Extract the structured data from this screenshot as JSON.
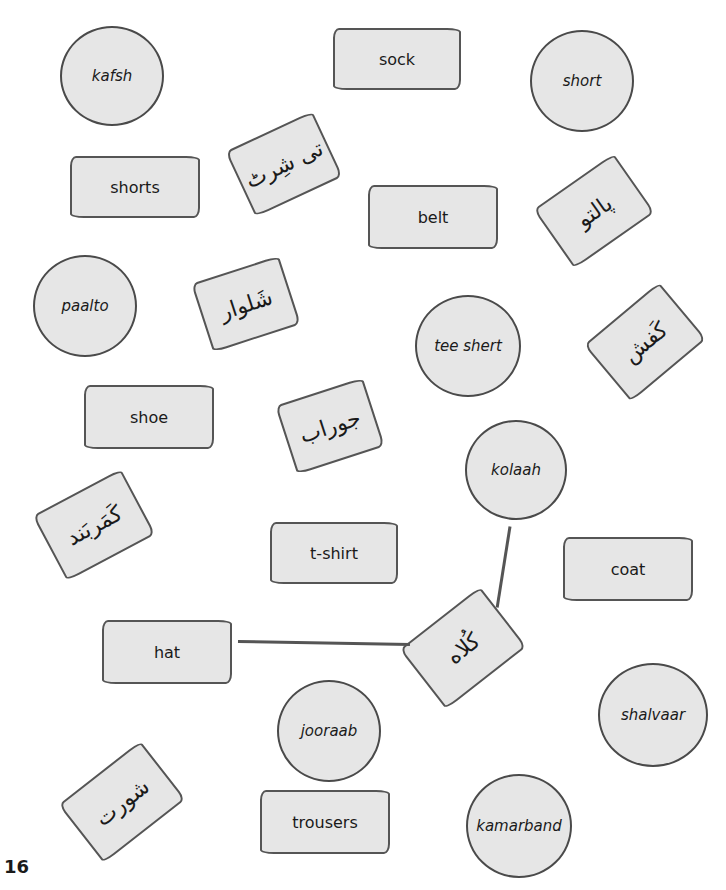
{
  "page": {
    "number": "16",
    "colors": {
      "card_fill": "#e6e6e6",
      "outline": "#4a4a4a",
      "background": "#ffffff"
    }
  },
  "circles": [
    {
      "id": "kafsh",
      "label": "kafsh"
    },
    {
      "id": "short",
      "label": "short"
    },
    {
      "id": "paalto",
      "label": "paalto"
    },
    {
      "id": "tee-shert",
      "label": "tee shert"
    },
    {
      "id": "kolaah",
      "label": "kolaah"
    },
    {
      "id": "jooraab",
      "label": "jooraab"
    },
    {
      "id": "shalvaar",
      "label": "shalvaar"
    },
    {
      "id": "kamarband",
      "label": "kamarband"
    }
  ],
  "english_cards": [
    {
      "id": "sock",
      "label": "sock"
    },
    {
      "id": "shorts",
      "label": "shorts"
    },
    {
      "id": "belt",
      "label": "belt"
    },
    {
      "id": "shoe",
      "label": "shoe"
    },
    {
      "id": "t-shirt",
      "label": "t-shirt"
    },
    {
      "id": "coat",
      "label": "coat"
    },
    {
      "id": "hat",
      "label": "hat"
    },
    {
      "id": "trousers",
      "label": "trousers"
    }
  ],
  "urdu_cards": [
    {
      "id": "tee-shirt-urdu",
      "label": "تی شِرٹ"
    },
    {
      "id": "paalto-urdu",
      "label": "پالتو"
    },
    {
      "id": "shalvaar-urdu",
      "label": "شَلوار"
    },
    {
      "id": "kafsh-urdu",
      "label": "کَفش"
    },
    {
      "id": "jooraab-urdu",
      "label": "جوراب"
    },
    {
      "id": "kamarband-urdu",
      "label": "کَمَربَند"
    },
    {
      "id": "kolaah-urdu",
      "label": "کُلاه"
    },
    {
      "id": "short-urdu",
      "label": "شورت"
    }
  ],
  "connections": [
    {
      "from": "hat",
      "to": "kolaah-urdu"
    },
    {
      "from": "kolaah",
      "to": "kolaah-urdu"
    }
  ]
}
